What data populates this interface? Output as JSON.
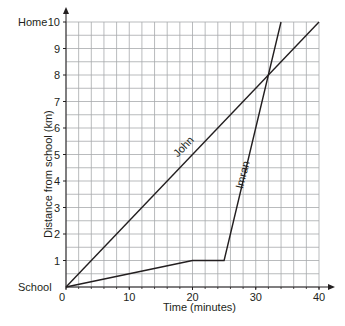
{
  "chart_data": {
    "type": "line",
    "title": "",
    "xlabel": "Time (minutes)",
    "ylabel": "Distance from school (km)",
    "xlim": [
      0,
      40
    ],
    "ylim": [
      0,
      10
    ],
    "x_ticks": [
      0,
      10,
      20,
      30,
      40
    ],
    "y_ticks": [
      1,
      2,
      3,
      4,
      5,
      6,
      7,
      8,
      9,
      10
    ],
    "x_minor_step": 2,
    "y_minor_step": 0.5,
    "grid": true,
    "y_endpoint_labels": {
      "top": "Home",
      "bottom": "School"
    },
    "origin_label": "0",
    "series": [
      {
        "name": "John",
        "points": [
          [
            0,
            0
          ],
          [
            40,
            10
          ]
        ]
      },
      {
        "name": "Imran",
        "points": [
          [
            0,
            0
          ],
          [
            20,
            1
          ],
          [
            25,
            1
          ],
          [
            34,
            10
          ]
        ]
      }
    ],
    "annotations": [
      {
        "text": "John",
        "at": [
          19,
          5.2
        ],
        "angle": -46
      },
      {
        "text": "Imran",
        "at": [
          28.5,
          4.2
        ],
        "angle": -76
      }
    ]
  },
  "colors": {
    "line": "#231f20",
    "grid": "#a7a9ac",
    "axis": "#231f20"
  }
}
